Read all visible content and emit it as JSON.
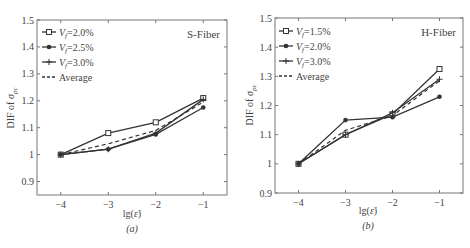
{
  "chart_data": [
    {
      "type": "line",
      "panel_label": "(a)",
      "annotation": "S-Fiber",
      "xlabel": "lg(ε̇)",
      "ylabel": "DIF of σ_pc",
      "x": [
        -4,
        -3,
        -2,
        -1
      ],
      "xticks": [
        "-4",
        "-3",
        "-2",
        "-1"
      ],
      "yticks": [
        "0.9",
        "1",
        "1.1",
        "1.2",
        "1.3",
        "1.4",
        "1.5"
      ],
      "ylim": [
        0.85,
        1.5
      ],
      "xlim": [
        -4.5,
        -0.5
      ],
      "grid": false,
      "legend_position": "upper left",
      "series": [
        {
          "name": "Vf=2.0%",
          "marker": "square",
          "style": "solid",
          "values": [
            1.0,
            1.08,
            1.12,
            1.21
          ]
        },
        {
          "name": "Vf=2.5%",
          "marker": "dot",
          "style": "solid",
          "values": [
            1.0,
            1.02,
            1.075,
            1.175
          ]
        },
        {
          "name": "Vf=3.0%",
          "marker": "plus",
          "style": "solid",
          "values": [
            1.0,
            1.02,
            1.08,
            1.205
          ]
        },
        {
          "name": "Average",
          "marker": "none",
          "style": "dashed",
          "values": [
            1.0,
            1.04,
            1.09,
            1.195
          ]
        }
      ]
    },
    {
      "type": "line",
      "panel_label": "(b)",
      "annotation": "H-Fiber",
      "xlabel": "lg(ε̇)",
      "ylabel": "DIF of σ_pc",
      "x": [
        -4,
        -3,
        -2,
        -1
      ],
      "xticks": [
        "-4",
        "-3",
        "-2",
        "-1"
      ],
      "yticks": [
        "0.9",
        "1",
        "1.1",
        "1.2",
        "1.3",
        "1.4",
        "1.5"
      ],
      "ylim": [
        0.9,
        1.5
      ],
      "xlim": [
        -4.5,
        -0.5
      ],
      "grid": false,
      "legend_position": "upper left",
      "series": [
        {
          "name": "Vf=1.5%",
          "marker": "square",
          "style": "solid",
          "values": [
            1.0,
            1.1,
            1.17,
            1.325
          ]
        },
        {
          "name": "Vf=2.0%",
          "marker": "dot",
          "style": "solid",
          "values": [
            1.0,
            1.15,
            1.16,
            1.23
          ]
        },
        {
          "name": "Vf=3.0%",
          "marker": "plus",
          "style": "solid",
          "values": [
            1.0,
            1.1,
            1.175,
            1.29
          ]
        },
        {
          "name": "Average",
          "marker": "none",
          "style": "dashed",
          "values": [
            1.0,
            1.115,
            1.165,
            1.285
          ]
        }
      ]
    }
  ],
  "panels": [
    {
      "label": "(a)",
      "annotation": "S-Fiber",
      "xlabel": "lg(ε̇)",
      "ylabel_main": "DIF of σ",
      "ylabel_sub": "pc",
      "legend": [
        {
          "prefix": "V",
          "sub": "f",
          "text": "=2.0%"
        },
        {
          "prefix": "V",
          "sub": "f",
          "text": "=2.5%"
        },
        {
          "prefix": "V",
          "sub": "f",
          "text": "=3.0%"
        },
        {
          "prefix": "",
          "sub": "",
          "text": "Average"
        }
      ]
    },
    {
      "label": "(b)",
      "annotation": "H-Fiber",
      "xlabel": "lg(ε̇)",
      "ylabel_main": "DIF of σ",
      "ylabel_sub": "pc",
      "legend": [
        {
          "prefix": "V",
          "sub": "f",
          "text": "=1.5%"
        },
        {
          "prefix": "V",
          "sub": "f",
          "text": "=2.0%"
        },
        {
          "prefix": "V",
          "sub": "f",
          "text": "=3.0%"
        },
        {
          "prefix": "",
          "sub": "",
          "text": "Average"
        }
      ]
    }
  ],
  "colors": {
    "line": "#333333",
    "axis": "#666666",
    "text": "#444444"
  }
}
